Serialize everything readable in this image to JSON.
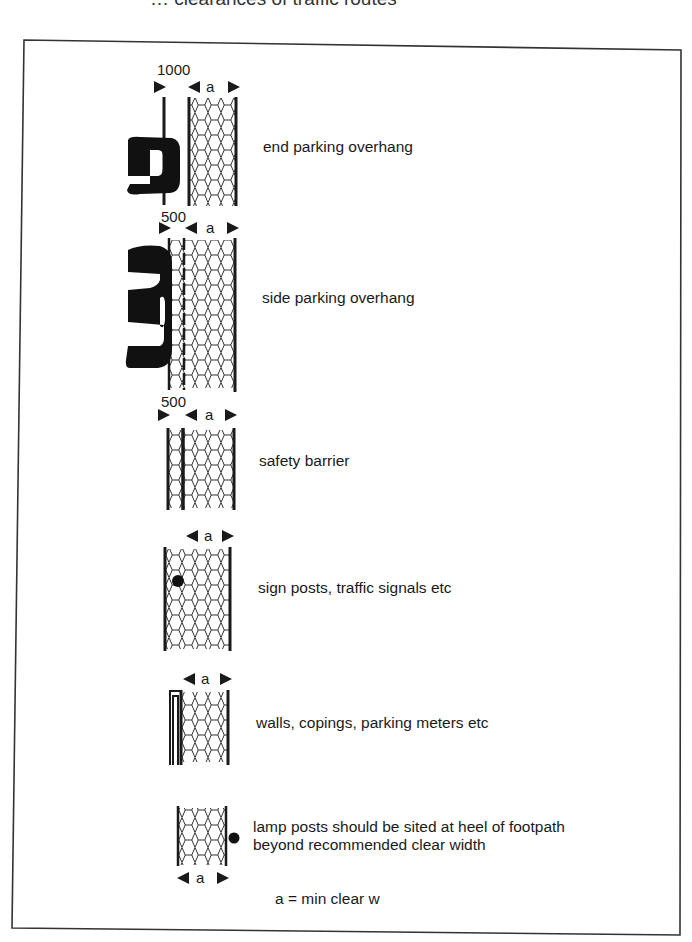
{
  "figure": {
    "caption_clipped": "… clearances of traffic routes",
    "colors": {
      "ink": "#1a1a1a",
      "paper": "#ffffff",
      "frame": "#333333"
    },
    "rows": [
      {
        "id": "end-parking",
        "offset_label": "1000",
        "width_label": "a",
        "description": "end parking overhang",
        "obstruction": "car-end"
      },
      {
        "id": "side-parking",
        "offset_label": "500",
        "width_label": "a",
        "description": "side parking overhang",
        "obstruction": "car-side"
      },
      {
        "id": "safety-barrier",
        "offset_label": "500",
        "width_label": "a",
        "description": "safety barrier",
        "obstruction": "barrier"
      },
      {
        "id": "sign-posts",
        "width_label": "a",
        "description": "sign posts, traffic signals etc",
        "obstruction": "post"
      },
      {
        "id": "walls",
        "width_label": "a",
        "description": "walls, copings, parking meters etc",
        "obstruction": "wall"
      },
      {
        "id": "lamp-posts",
        "width_label": "a",
        "description_line1": "lamp posts should be sited at heel of footpath",
        "description_line2": "beyond recommended clear width",
        "obstruction": "lamp-post"
      }
    ],
    "legend": "a = min clear w"
  }
}
